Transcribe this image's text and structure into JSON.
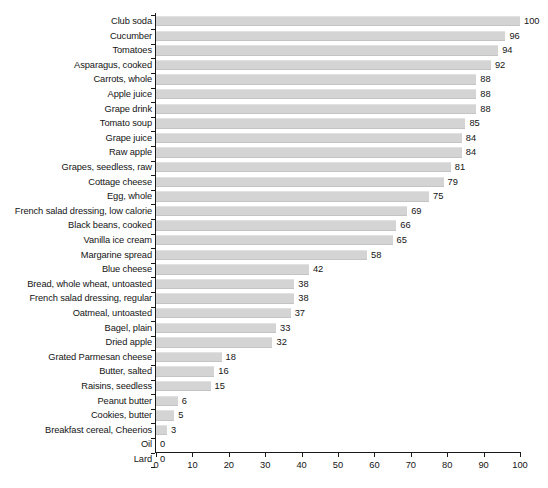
{
  "chart_data": {
    "type": "bar",
    "orientation": "horizontal",
    "title": "",
    "subtitle": "",
    "xlabel": "",
    "ylabel": "",
    "xlim": [
      0,
      100
    ],
    "xticks": [
      0,
      10,
      20,
      30,
      40,
      50,
      60,
      70,
      80,
      90,
      100
    ],
    "xtick_labels": [
      "0",
      "10",
      "20",
      "30",
      "40",
      "50",
      "60",
      "70",
      "80",
      "90",
      "100"
    ],
    "grid": false,
    "legend": null,
    "bar_color": "#d4d4d4",
    "axis_color": "#1a1a1a",
    "text_color": "#141414",
    "categories": [
      "Club soda",
      "Cucumber",
      "Tomatoes",
      "Asparagus, cooked",
      "Carrots, whole",
      "Apple juice",
      "Grape drink",
      "Tomato soup",
      "Grape juice",
      "Raw apple",
      "Grapes, seedless, raw",
      "Cottage cheese",
      "Egg, whole",
      "French salad dressing, low calorie",
      "Black beans, cooked",
      "Vanilla ice cream",
      "Margarine spread",
      "Blue cheese",
      "Bread, whole wheat, untoasted",
      "French salad dressing, regular",
      "Oatmeal, untoasted",
      "Bagel, plain",
      "Dried apple",
      "Grated Parmesan cheese",
      "Butter, salted",
      "Raisins, seedless",
      "Peanut butter",
      "Cookies, butter",
      "Breakfast cereal, Cheerios",
      "Oil",
      "Lard"
    ],
    "values": [
      100,
      96,
      94,
      92,
      88,
      88,
      88,
      85,
      84,
      84,
      81,
      79,
      75,
      69,
      66,
      65,
      58,
      42,
      38,
      38,
      37,
      33,
      32,
      18,
      16,
      15,
      6,
      5,
      3,
      0,
      0
    ],
    "value_labels": [
      "100",
      "96",
      "94",
      "92",
      "88",
      "88",
      "88",
      "85",
      "84",
      "84",
      "81",
      "79",
      "75",
      "69",
      "66",
      "65",
      "58",
      "42",
      "38",
      "38",
      "37",
      "33",
      "32",
      "18",
      "16",
      "15",
      "6",
      "5",
      "3",
      "0",
      "0"
    ]
  }
}
